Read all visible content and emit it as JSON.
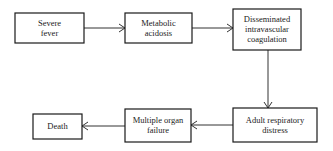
{
  "diagram": {
    "type": "flowchart",
    "nodes": [
      {
        "id": "severe-fever",
        "lines": [
          "Severe",
          "fever"
        ]
      },
      {
        "id": "metabolic-acidosis",
        "lines": [
          "Metabolic",
          "acidosis"
        ]
      },
      {
        "id": "dic",
        "lines": [
          "Disseminated",
          "intravascular",
          "coagulation"
        ]
      },
      {
        "id": "ards",
        "lines": [
          "Adult respiratory",
          "distress"
        ]
      },
      {
        "id": "multiple-organ-failure",
        "lines": [
          "Multiple organ",
          "failure"
        ]
      },
      {
        "id": "death",
        "lines": [
          "Death"
        ]
      }
    ],
    "edges": [
      {
        "from": "severe-fever",
        "to": "metabolic-acidosis"
      },
      {
        "from": "metabolic-acidosis",
        "to": "dic"
      },
      {
        "from": "dic",
        "to": "ards"
      },
      {
        "from": "ards",
        "to": "multiple-organ-failure"
      },
      {
        "from": "multiple-organ-failure",
        "to": "death"
      }
    ]
  }
}
